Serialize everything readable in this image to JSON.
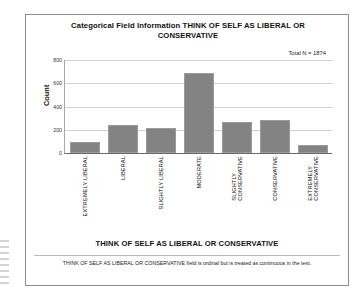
{
  "figure": {
    "title": "Categorical Field Information THINK OF SELF AS LIBERAL OR CONSERVATIVE",
    "annotation": "Total N =  1874",
    "footnote": "THINK OF SELF AS LIBERAL OR CONSERVATIVE field is ordinal but is treated as continuous in the test.",
    "bar_color": "#838383",
    "grid_color": "#d2d2d2",
    "frame_color": "#8d8d8d"
  },
  "chart_data": {
    "type": "bar",
    "title": "Categorical Field Information THINK OF SELF AS LIBERAL OR CONSERVATIVE",
    "xlabel": "THINK OF SELF AS LIBERAL OR CONSERVATIVE",
    "ylabel": "Count",
    "categories": [
      "EXTREMELY LIBERAL",
      "LIBERAL",
      "SLIGHTLY LIBERAL",
      "MODERATE",
      "SLIGHTLY\nCONSERVATIVE",
      "CONSERVATIVE",
      "EXTREMELY\nCONSERVATIVE"
    ],
    "values": [
      95,
      240,
      215,
      690,
      265,
      285,
      70
    ],
    "ylim": [
      0,
      800
    ],
    "yticks": [
      0,
      200,
      400,
      600,
      800
    ],
    "ytick_labels": [
      "0",
      "200",
      "400",
      "600",
      "800"
    ],
    "grid": true,
    "legend": false,
    "total_n": 1874,
    "annotations": [
      "Total N =  1874"
    ]
  }
}
